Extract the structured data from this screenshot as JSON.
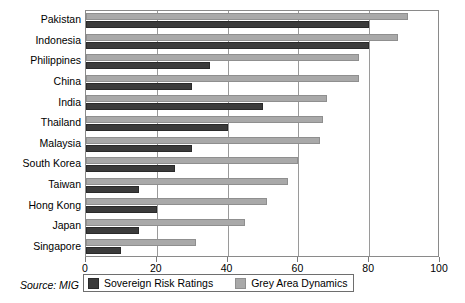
{
  "chart_data": {
    "type": "bar",
    "orientation": "horizontal",
    "title": "",
    "xlabel": "",
    "ylabel": "",
    "xlim": [
      0,
      100
    ],
    "xticks": [
      0,
      20,
      40,
      60,
      80,
      100
    ],
    "grid": true,
    "legend_position": "bottom",
    "categories": [
      "Pakistan",
      "Indonesia",
      "Philippines",
      "China",
      "India",
      "Thailand",
      "Malaysia",
      "South Korea",
      "Taiwan",
      "Hong Kong",
      "Japan",
      "Singapore"
    ],
    "series": [
      {
        "name": "Sovereign Risk Ratings",
        "color": "#3b3b3b",
        "values": [
          80,
          80,
          35,
          30,
          50,
          40,
          30,
          25,
          15,
          20,
          15,
          10
        ]
      },
      {
        "name": "Grey Area Dynamics",
        "color": "#a9a9a9",
        "values": [
          91,
          88,
          77,
          77,
          68,
          67,
          66,
          60,
          57,
          51,
          45,
          31
        ]
      }
    ]
  },
  "source": {
    "note": "Source: MIG"
  },
  "legend": {
    "items": [
      {
        "label": "Sovereign Risk Ratings",
        "swatch": "dark-swatch-icon"
      },
      {
        "label": "Grey Area Dynamics",
        "swatch": "grey-swatch-icon"
      }
    ]
  }
}
